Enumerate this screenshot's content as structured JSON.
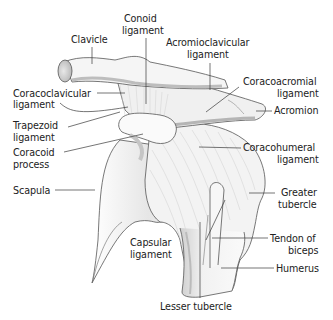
{
  "diagram": {
    "colors": {
      "background": "#ffffff",
      "bone_fill": "#f4f4f4",
      "shadow": "#bdbdbd",
      "outline": "#4a4a4a",
      "leader_line": "#3a3a3a",
      "text": "#222222"
    },
    "labels": {
      "clavicle": "Clavicle",
      "conoid_1": "Conoid",
      "conoid_2": "ligament",
      "acromioclavicular_1": "Acromioclavicular",
      "acromioclavicular_2": "ligament",
      "coracoclavicular_1": "Coracoclavicular",
      "coracoclavicular_2": "ligament",
      "coracoacromial_1": "Coracoacromial",
      "coracoacromial_2": "ligament",
      "acromion": "Acromion",
      "trapezoid_1": "Trapezoid",
      "trapezoid_2": "ligament",
      "coracoid_1": "Coracoid",
      "coracoid_2": "process",
      "coracohumeral_1": "Coracohumeral",
      "coracohumeral_2": "ligament",
      "scapula": "Scapula",
      "greater_tubercle_1": "Greater",
      "greater_tubercle_2": "tubercle",
      "capsular_1": "Capsular",
      "capsular_2": "ligament",
      "tendon_biceps_1": "Tendon of",
      "tendon_biceps_2": "biceps",
      "humerus": "Humerus",
      "lesser_tubercle": "Lesser tubercle"
    }
  }
}
